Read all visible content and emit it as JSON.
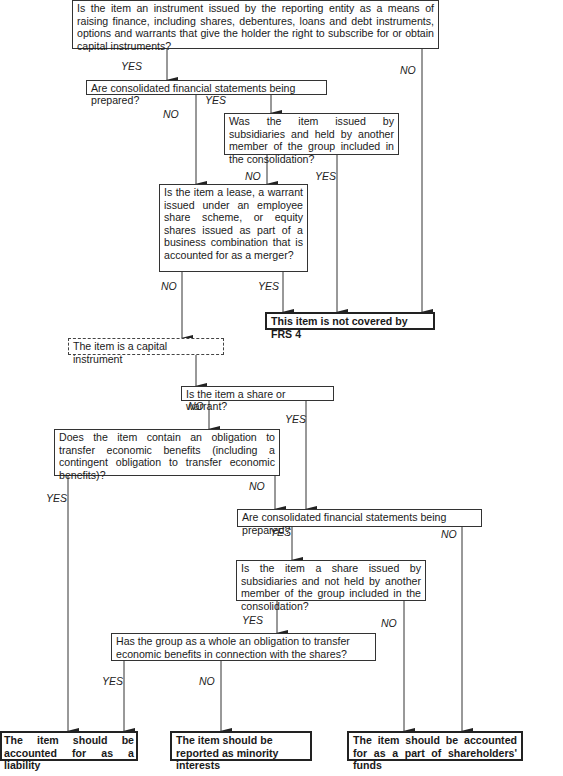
{
  "diagram": {
    "nodes": {
      "q_instrument": "Is the item an instrument issued by the reporting entity as a means of raising finance, including shares, debentures, loans and debt instruments, options and warrants that give the holder the right to subscribe for or obtain capital instruments?",
      "q_consolidated_1": "Are consolidated financial statements being prepared?",
      "q_issued_subsidiaries": "Was the item issued by subsidiaries and held by another member of the group included in the consolidation?",
      "q_lease_warrant": "Is the item a lease, a warrant issued under an employee share scheme, or equity shares issued as part of a business combination that is accounted for as a  merger?",
      "r_not_covered": "This item is not covered by FRS 4",
      "r_capital_instrument": "The item is a capital instrument",
      "q_share_warrant": "Is the item a share or warrant?",
      "q_obligation": "Does the item contain an obligation to transfer economic benefits (including a contingent obligation to transfer economic benefits)?",
      "q_consolidated_2": "Are consolidated financial statements being prepared?",
      "q_share_subsidiaries": "Is the item a share issued by subsidiaries and not held by another member of the group included in the consolidation?",
      "q_group_obligation": "Has the group as a whole an obligation to transfer economic benefits in connection with the shares?",
      "r_liability": "The item should be accounted for as a liability",
      "r_minority": "The item should be reported as minority interests",
      "r_shareholders": "The item should be accounted for as a part of shareholders' funds"
    },
    "labels": {
      "yes_1": "YES",
      "no_1": "NO",
      "yes_2": "YES",
      "no_2": "NO",
      "no_3": "NO",
      "yes_3": "YES",
      "no_4": "NO",
      "yes_4": "YES",
      "no_5": "NO",
      "yes_5": "YES",
      "yes_6": "YES",
      "no_6": "NO",
      "yes_7": "YES",
      "no_7": "NO",
      "yes_8": "YES",
      "no_8": "NO",
      "yes_9": "YES",
      "no_9": "NO"
    }
  }
}
